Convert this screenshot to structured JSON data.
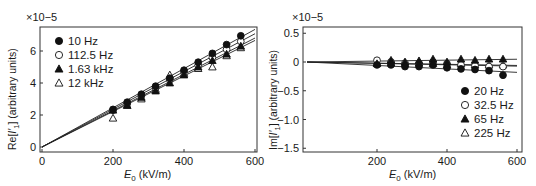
{
  "chart_data": [
    {
      "type": "scatter",
      "title": "",
      "multiplier_label": "×10−5",
      "xlabel": "E0 (kV/m)",
      "xlabel_main": "E",
      "xlabel_sub": "0",
      "xlabel_units": " (kV/m)",
      "ylabel": "Re[I′1] (arbitrary units)",
      "ylabel_prefix": "Re[",
      "ylabel_var": "I′",
      "ylabel_sub": "1",
      "ylabel_suffix": "] (arbitrary units)",
      "xlim": [
        0,
        600
      ],
      "ylim": [
        0,
        7.4
      ],
      "xticks": [
        0,
        200,
        400,
        600
      ],
      "yticks": [
        0,
        2,
        4,
        6
      ],
      "xtick_labels": [
        "0",
        "200",
        "400",
        "600"
      ],
      "ytick_labels": [
        "0",
        "2",
        "4",
        "6"
      ],
      "grid": false,
      "legend_position": "upper left",
      "x": [
        200,
        240,
        280,
        320,
        360,
        400,
        440,
        480,
        520,
        560
      ],
      "series": [
        {
          "name": "10 Hz",
          "marker": "filled-circle",
          "values": [
            2.35,
            2.8,
            3.3,
            3.8,
            4.3,
            4.8,
            5.3,
            5.85,
            6.4,
            6.95
          ],
          "fit_slope": 0.01225
        },
        {
          "name": "112.5 Hz",
          "marker": "open-circle",
          "values": [
            2.3,
            2.7,
            3.2,
            3.7,
            4.2,
            4.7,
            5.1,
            5.6,
            6.1,
            6.6
          ],
          "fit_slope": 0.0118
        },
        {
          "name": "1.63 kHz",
          "marker": "filled-triangle",
          "values": [
            2.3,
            2.6,
            3.1,
            3.5,
            4.0,
            4.5,
            5.0,
            5.4,
            5.8,
            6.3
          ],
          "fit_slope": 0.01135
        },
        {
          "name": "12 kHz",
          "marker": "open-triangle",
          "values": [
            1.8,
            2.6,
            3.0,
            3.6,
            4.5,
            4.6,
            4.9,
            5.0,
            5.7,
            6.2
          ],
          "fit_slope": 0.0111
        }
      ]
    },
    {
      "type": "scatter",
      "title": "",
      "multiplier_label": "×10−5",
      "xlabel": "E0 (kV/m)",
      "xlabel_main": "E",
      "xlabel_sub": "0",
      "xlabel_units": " (kV/m)",
      "ylabel": "Im[I′1] (arbitrary units)",
      "ylabel_prefix": "Im[",
      "ylabel_var": "I′",
      "ylabel_sub": "1",
      "ylabel_suffix": "] (arbitrary units)",
      "xlim": [
        0,
        600
      ],
      "ylim": [
        -1.55,
        0.6
      ],
      "xticks": [
        200,
        400,
        600
      ],
      "yticks": [
        0.5,
        0,
        -0.5,
        -1.0,
        -1.5
      ],
      "xtick_labels": [
        "200",
        "400",
        "600"
      ],
      "ytick_labels": [
        "0.5",
        "0",
        "−0.5",
        "−1.0",
        "−1.5"
      ],
      "grid": false,
      "legend_position": "lower right",
      "x": [
        200,
        240,
        280,
        320,
        360,
        400,
        440,
        480,
        520,
        560
      ],
      "series": [
        {
          "name": "20 Hz",
          "marker": "filled-circle",
          "values": [
            -0.05,
            -0.05,
            -0.08,
            -0.08,
            -0.05,
            -0.1,
            -0.12,
            -0.13,
            -0.15,
            -0.23
          ],
          "fit_slope": -0.0003
        },
        {
          "name": "32.5 Hz",
          "marker": "open-circle",
          "values": [
            0.03,
            0.0,
            -0.02,
            -0.02,
            0.0,
            -0.03,
            -0.05,
            -0.06,
            -0.08,
            -0.08
          ],
          "fit_slope": -0.00012
        },
        {
          "name": "65 Hz",
          "marker": "filled-triangle",
          "values": [
            -0.03,
            0.03,
            0.0,
            0.02,
            0.05,
            0.0,
            0.05,
            0.03,
            0.05,
            0.05
          ],
          "fit_slope": 8e-05
        },
        {
          "name": "225 Hz",
          "marker": "open-triangle",
          "values": [
            -0.02,
            -0.02,
            -0.03,
            -0.02,
            -0.03,
            -0.05,
            -0.03,
            -0.05,
            -0.05,
            -0.05
          ],
          "fit_slope": -0.0001
        }
      ]
    }
  ]
}
